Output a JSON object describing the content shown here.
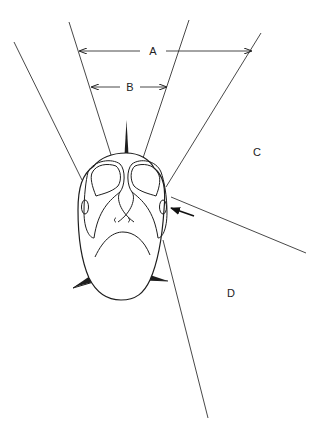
{
  "diagram": {
    "labels": {
      "A": "A",
      "B": "B",
      "C": "C",
      "D": "D"
    },
    "dimensions": [
      {
        "id": "A",
        "description": "width between outer-left sector line and outer-right sector line",
        "arrow": "double-headed horizontal"
      },
      {
        "id": "B",
        "description": "width between inner sector lines",
        "arrow": "double-headed horizontal"
      }
    ],
    "regions": [
      {
        "id": "C",
        "position": "upper right, between outer-right line and lateral line"
      },
      {
        "id": "D",
        "position": "lower right, between lateral line and posterior line"
      }
    ],
    "annotations": [
      {
        "type": "arrow",
        "points_to": "right eye / lateral opening",
        "direction": "left"
      }
    ],
    "colors": {
      "line": "#333333",
      "outline": "#1e1e1e",
      "background": "#ffffff"
    }
  }
}
